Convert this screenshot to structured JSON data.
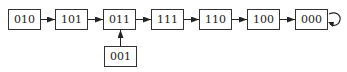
{
  "diagram": {
    "type": "state-transition",
    "nodes": [
      {
        "id": "n1",
        "label": "010",
        "x": 8,
        "y": 9
      },
      {
        "id": "n2",
        "label": "101",
        "x": 55,
        "y": 9
      },
      {
        "id": "n3",
        "label": "011",
        "x": 103,
        "y": 9
      },
      {
        "id": "n4",
        "label": "111",
        "x": 151,
        "y": 9
      },
      {
        "id": "n5",
        "label": "110",
        "x": 199,
        "y": 9
      },
      {
        "id": "n6",
        "label": "100",
        "x": 247,
        "y": 9
      },
      {
        "id": "n7",
        "label": "000",
        "x": 295,
        "y": 9
      },
      {
        "id": "n8",
        "label": "001",
        "x": 104,
        "y": 46
      }
    ],
    "edges": [
      {
        "from": "010",
        "to": "101"
      },
      {
        "from": "101",
        "to": "011"
      },
      {
        "from": "011",
        "to": "111"
      },
      {
        "from": "111",
        "to": "110"
      },
      {
        "from": "110",
        "to": "100"
      },
      {
        "from": "100",
        "to": "000"
      },
      {
        "from": "001",
        "to": "011"
      },
      {
        "from": "000",
        "to": "000",
        "self_loop": true
      }
    ]
  }
}
